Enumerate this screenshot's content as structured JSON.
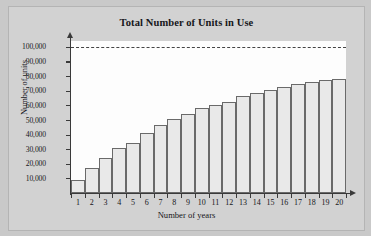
{
  "chart_data": {
    "type": "bar",
    "title": "Total Number of Units in Use",
    "xlabel": "Number of years",
    "ylabel": "Number of units",
    "categories": [
      1,
      2,
      3,
      4,
      5,
      6,
      7,
      8,
      9,
      10,
      11,
      12,
      13,
      14,
      15,
      16,
      17,
      18,
      19,
      20
    ],
    "values": [
      9000,
      17000,
      24000,
      30500,
      34000,
      41000,
      46500,
      50500,
      54000,
      58000,
      60500,
      62000,
      66500,
      68500,
      70500,
      72500,
      74500,
      76000,
      77000,
      78000
    ],
    "ylim": [
      0,
      104000
    ],
    "yticks": [
      10000,
      20000,
      30000,
      40000,
      50000,
      60000,
      70000,
      80000,
      90000,
      100000
    ],
    "ytick_labels": [
      "10,000",
      "20,000",
      "30,000",
      "40,000",
      "50,000",
      "60,000",
      "70,000",
      "80,000",
      "90,000",
      "100,000"
    ],
    "xticks": [
      1,
      2,
      3,
      4,
      5,
      6,
      7,
      8,
      9,
      10,
      11,
      12,
      13,
      14,
      15,
      16,
      17,
      18,
      19,
      20
    ],
    "grid": false,
    "legend": null,
    "annotations": [
      {
        "name": "asymptote",
        "type": "horizontal-dashed-line",
        "value": 100000
      }
    ],
    "colors": {
      "bar_fill": "#e9e9e9",
      "bar_edge": "#6a6a6a",
      "axis": "#3a3a3a",
      "plot_background": "#fdfdfd",
      "figure_background": "#d2d2d2",
      "text": "#16161a"
    }
  }
}
